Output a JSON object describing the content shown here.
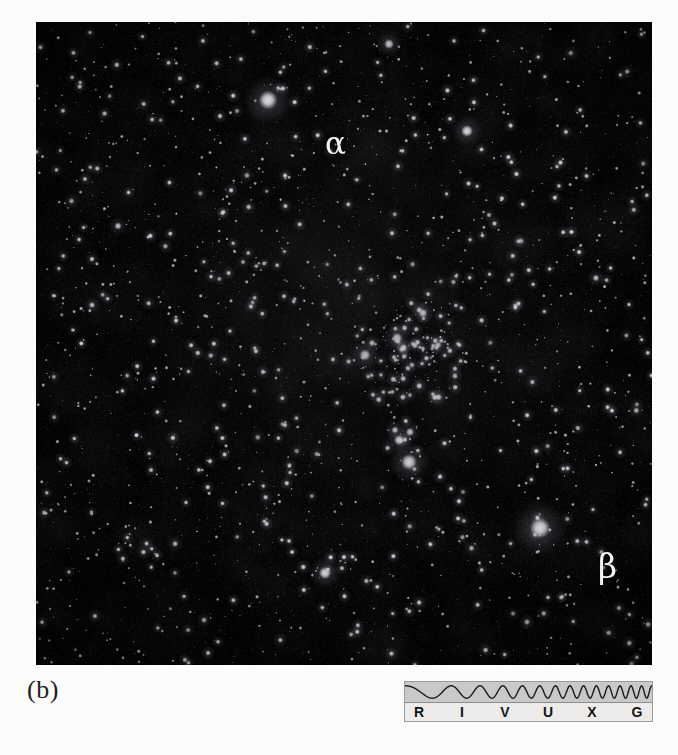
{
  "figure": {
    "panel_letter": "(b)",
    "caption_type": "astronomical-photograph"
  },
  "photo": {
    "kind": "star-field",
    "description": "dense optical star field with an open star cluster near center",
    "background_color": "#050505",
    "star_color": "#ffffff",
    "labels": [
      {
        "name": "alpha",
        "text": "α",
        "x": 289,
        "y": 106
      },
      {
        "name": "beta",
        "text": "β",
        "x": 562,
        "y": 528
      }
    ]
  },
  "spectrum_key": {
    "name": "electromagnetic-spectrum-key",
    "wave_color": "#1a1a1a",
    "wave_band_color": "#c9c9c7",
    "label_band_color": "#edeceb",
    "border_color": "#9b9b99",
    "bands": [
      {
        "code": "R",
        "name": "radio",
        "x": 6
      },
      {
        "code": "I",
        "name": "infrared",
        "x": 49
      },
      {
        "code": "V",
        "name": "visible",
        "x": 92
      },
      {
        "code": "U",
        "name": "ultraviolet",
        "x": 135
      },
      {
        "code": "X",
        "name": "x-ray",
        "x": 179
      },
      {
        "code": "G",
        "name": "gamma-ray",
        "x": 224
      }
    ]
  },
  "stars": {
    "bright": [
      {
        "x": 268,
        "y": 100,
        "r": 9.5,
        "i": 1.0
      },
      {
        "x": 540,
        "y": 528,
        "r": 10.5,
        "i": 1.0
      },
      {
        "x": 467,
        "y": 131,
        "r": 6.0,
        "i": 0.95
      },
      {
        "x": 325,
        "y": 573,
        "r": 6.2,
        "i": 0.95
      },
      {
        "x": 409,
        "y": 462,
        "r": 8.0,
        "i": 1.0
      },
      {
        "x": 399,
        "y": 440,
        "r": 5.2,
        "i": 0.92
      },
      {
        "x": 410,
        "y": 432,
        "r": 4.2,
        "i": 0.88
      },
      {
        "x": 395,
        "y": 430,
        "r": 3.6,
        "i": 0.85
      },
      {
        "x": 365,
        "y": 355,
        "r": 5.8,
        "i": 0.95
      },
      {
        "x": 397,
        "y": 338,
        "r": 5.4,
        "i": 0.95
      },
      {
        "x": 423,
        "y": 313,
        "r": 4.6,
        "i": 0.92
      },
      {
        "x": 438,
        "y": 345,
        "r": 3.4,
        "i": 0.82
      },
      {
        "x": 412,
        "y": 365,
        "r": 3.0,
        "i": 0.8
      },
      {
        "x": 455,
        "y": 376,
        "r": 3.2,
        "i": 0.8
      },
      {
        "x": 389,
        "y": 44,
        "r": 5.0,
        "i": 0.92
      },
      {
        "x": 596,
        "y": 278,
        "r": 3.4,
        "i": 0.8
      },
      {
        "x": 118,
        "y": 226,
        "r": 3.6,
        "i": 0.82
      },
      {
        "x": 92,
        "y": 305,
        "r": 3.2,
        "i": 0.78
      },
      {
        "x": 204,
        "y": 620,
        "r": 3.0,
        "i": 0.78
      },
      {
        "x": 527,
        "y": 622,
        "r": 3.2,
        "i": 0.78
      },
      {
        "x": 619,
        "y": 608,
        "r": 2.8,
        "i": 0.75
      },
      {
        "x": 151,
        "y": 470,
        "r": 2.8,
        "i": 0.75
      },
      {
        "x": 489,
        "y": 215,
        "r": 2.6,
        "i": 0.74
      },
      {
        "x": 243,
        "y": 262,
        "r": 2.6,
        "i": 0.74
      }
    ],
    "field_count": 2600,
    "cluster": {
      "cx": 408,
      "cy": 352,
      "rx": 62,
      "ry": 55,
      "count": 150
    }
  }
}
